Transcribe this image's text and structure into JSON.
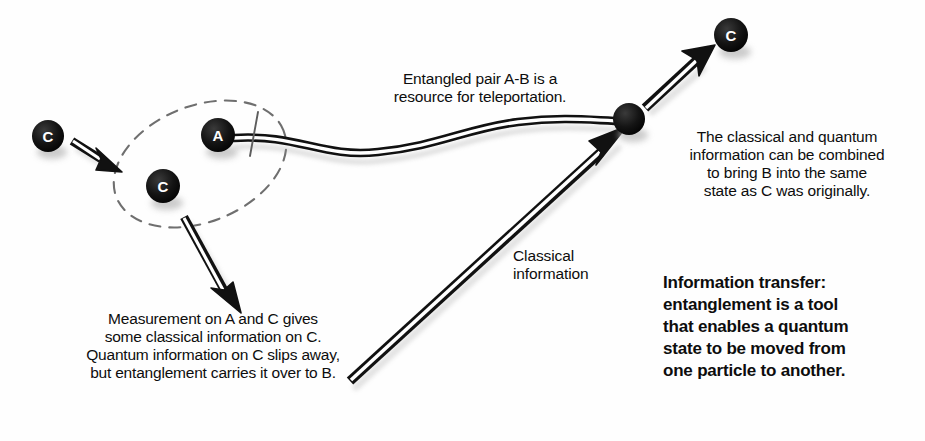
{
  "diagram": {
    "background_color": "#fefefe",
    "ink_color": "#111111",
    "particle_fill": "#111111",
    "particle_label_color": "#ffffff"
  },
  "captions": {
    "entangled_pair": "Entangled pair A-B is a\nresource for teleportation.",
    "combined": "The classical and quantum\ninformation can be combined\nto bring B into the same\nstate as C was originally.",
    "measurement": "Measurement on A and C gives\nsome classical information on C.\nQuantum information on C slips away,\nbut entanglement carries it over to B.",
    "classical_information": "Classical\ninformation",
    "summary": "Information transfer:\nentanglement is a tool\nthat enables a quantum\nstate to be moved from\none particle to another."
  },
  "particles": [
    {
      "id": "c-source",
      "label": "C",
      "cx": 48,
      "cy": 136,
      "r": 16
    },
    {
      "id": "a-entangled",
      "label": "A",
      "cx": 218,
      "cy": 135,
      "r": 17
    },
    {
      "id": "c-measured",
      "label": "C",
      "cx": 163,
      "cy": 186,
      "r": 17
    },
    {
      "id": "b-entangled",
      "label": "",
      "cx": 629,
      "cy": 119,
      "r": 16
    },
    {
      "id": "c-destination",
      "label": "C",
      "cx": 731,
      "cy": 35,
      "r": 17
    }
  ],
  "arrows": [
    {
      "id": "c-into-group",
      "from_x": 74,
      "from_y": 143,
      "to_x": 120,
      "to_y": 170
    },
    {
      "id": "measurement-outcome",
      "from_x": 184,
      "from_y": 217,
      "to_x": 240,
      "to_y": 312
    },
    {
      "id": "classical-channel",
      "from_x": 349,
      "from_y": 380,
      "to_x": 627,
      "to_y": 126
    },
    {
      "id": "b-becomes-c",
      "from_x": 646,
      "from_y": 107,
      "to_x": 714,
      "to_y": 48
    }
  ],
  "links": [
    {
      "id": "entanglement-wave",
      "from": "a-entangled",
      "to": "b-entangled",
      "style": "wavy-double-line"
    }
  ],
  "grouping": {
    "id": "measurement-region",
    "shape": "dashed-ellipse",
    "cx": 200,
    "cy": 164,
    "rx": 90,
    "ry": 58,
    "rotation_deg": -22
  }
}
